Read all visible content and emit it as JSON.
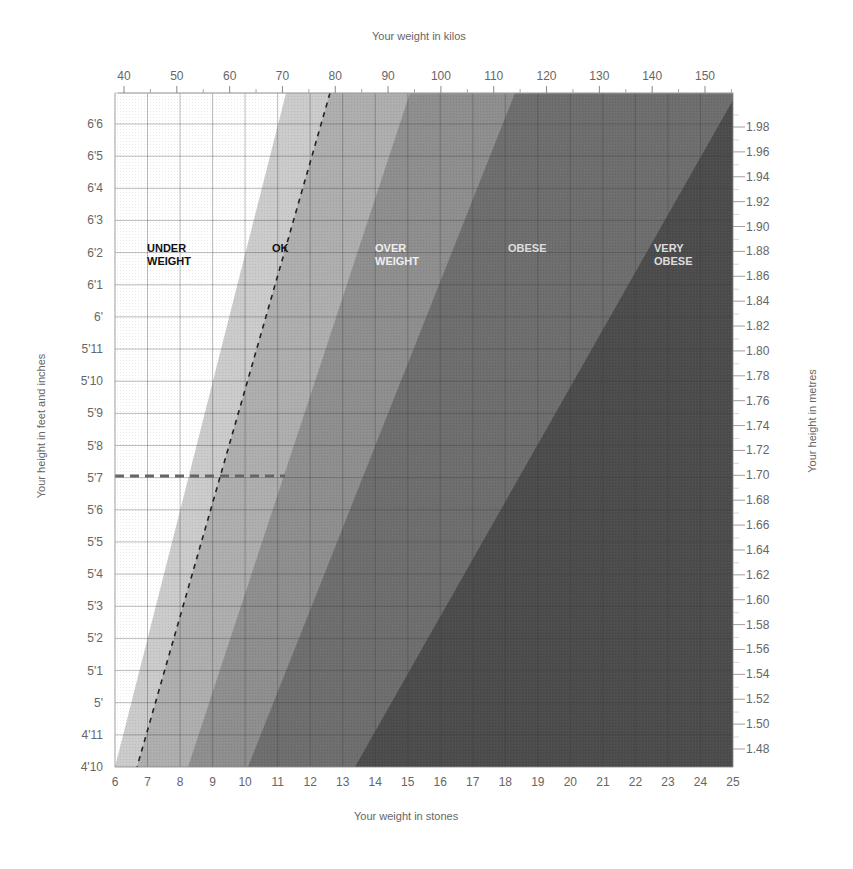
{
  "chart_data": {
    "type": "area",
    "title": "",
    "top_axis": {
      "label": "Your weight in kilos",
      "ticks": [
        40,
        50,
        60,
        70,
        80,
        90,
        100,
        110,
        120,
        130,
        140,
        150
      ]
    },
    "bottom_axis": {
      "label": "Your weight in stones",
      "ticks": [
        6,
        7,
        8,
        9,
        10,
        11,
        12,
        13,
        14,
        15,
        16,
        17,
        18,
        19,
        20,
        21,
        22,
        23,
        24,
        25
      ],
      "range": [
        6,
        25
      ]
    },
    "left_axis": {
      "label": "Your height in feet and inches",
      "ticks": [
        "6'6",
        "6'5",
        "6'4",
        "6'3",
        "6'2",
        "6'1",
        "6'",
        "5'11",
        "5'10",
        "5'9",
        "5'8",
        "5'7",
        "5'6",
        "5'5",
        "5'4",
        "5'3",
        "5'2",
        "5'1",
        "5'",
        "4'11",
        "4'10"
      ]
    },
    "right_axis": {
      "label": "Your height in metres",
      "ticks": [
        "1.98",
        "1.96",
        "1.94",
        "1.92",
        "1.90",
        "1.88",
        "1.86",
        "1.84",
        "1.82",
        "1.80",
        "1.78",
        "1.76",
        "1.74",
        "1.72",
        "1.70",
        "1.68",
        "1.66",
        "1.64",
        "1.62",
        "1.60",
        "1.58",
        "1.56",
        "1.54",
        "1.52",
        "1.50",
        "1.48"
      ]
    },
    "zones": [
      {
        "name": "UNDER WEIGHT",
        "lines": [
          "UNDER",
          "WEIGHT"
        ],
        "color": "#ffffff",
        "text_color": "#111111"
      },
      {
        "name": "OK",
        "lines": [
          "OK"
        ],
        "color": "#c8c8c8",
        "text_color": "#111111"
      },
      {
        "name": "OVER WEIGHT",
        "lines": [
          "OVER",
          "WEIGHT"
        ],
        "color": "#8c8c8c",
        "text_color": "#eeeeee"
      },
      {
        "name": "OBESE",
        "lines": [
          "OBESE"
        ],
        "color": "#6a6a6a",
        "text_color": "#dddddd"
      },
      {
        "name": "VERY OBESE",
        "lines": [
          "VERY",
          "OBESE"
        ],
        "color": "#4a4a4a",
        "text_color": "#dddddd"
      }
    ],
    "boundaries_stones": [
      {
        "name": "under/ok",
        "at_4ft10": 6.0,
        "at_6ft7": 11.3
      },
      {
        "name": "ideal dashed line",
        "at_4ft10": 6.7,
        "at_6ft7": 12.6
      },
      {
        "name": "ok/over",
        "at_4ft10": 8.3,
        "at_6ft7": 15.1
      },
      {
        "name": "over/obese",
        "at_4ft10": 10.1,
        "at_6ft7": 18.3
      },
      {
        "name": "obese/very obese",
        "at_4ft10": 13.4,
        "at_6ft7": 25.0
      }
    ],
    "annotations": [
      {
        "type": "dashed-horizontal",
        "height": "5'7",
        "metres": "1.70"
      },
      {
        "type": "dashed-diagonal",
        "description": "ideal weight line within OK band"
      }
    ],
    "grid": true,
    "legend": "none (zones labelled in chart)"
  }
}
